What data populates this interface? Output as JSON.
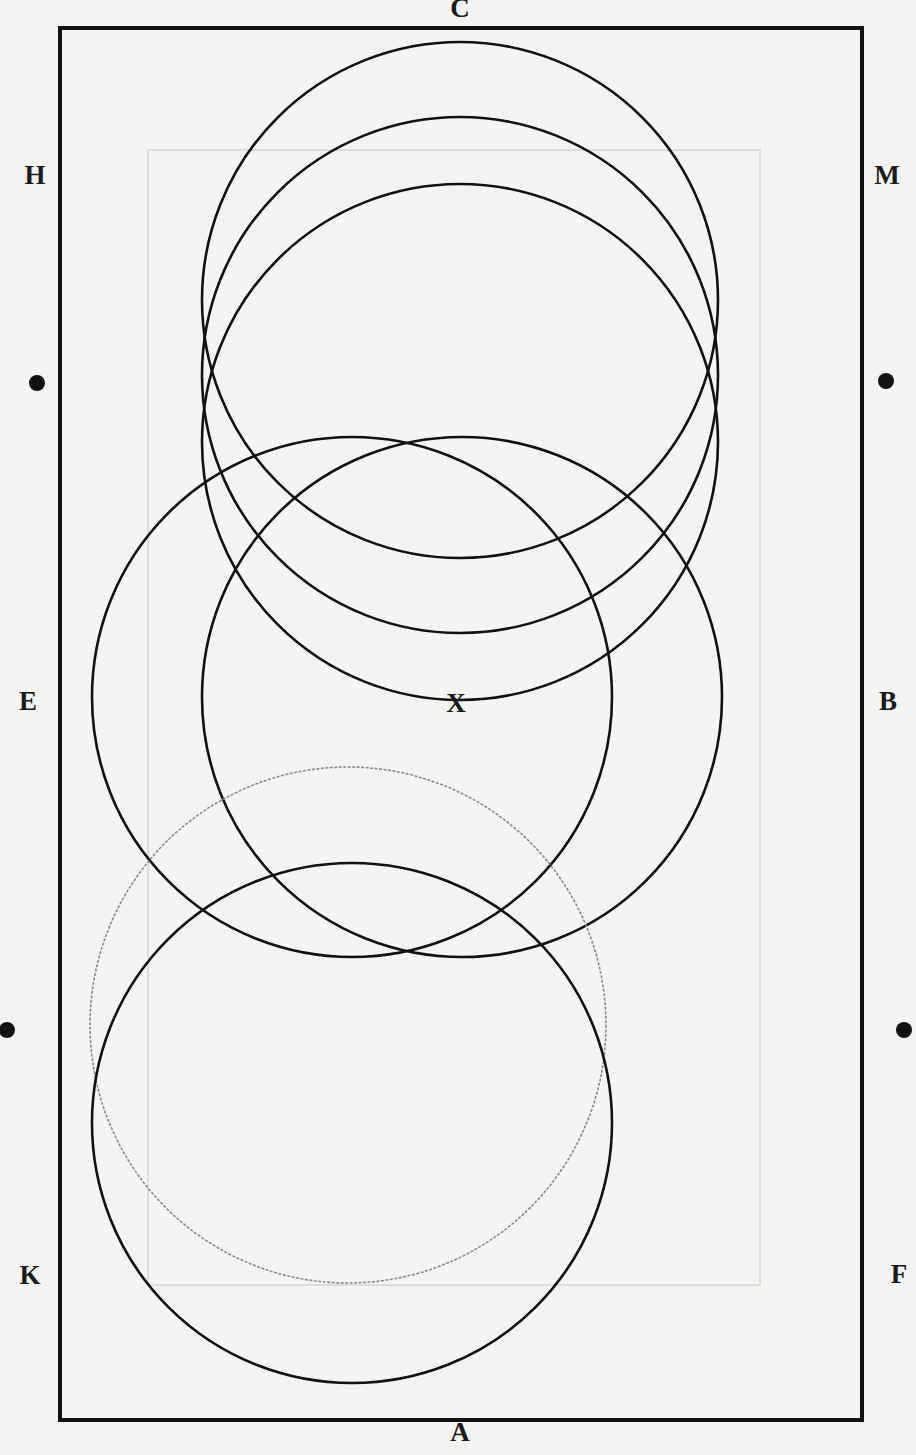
{
  "diagram": {
    "colors": {
      "background": "#f4f4f2",
      "line": "#111111",
      "faint_line": "#8a8a8a",
      "ghost_rect": "#dcdcd8"
    },
    "arena": {
      "x": 60,
      "y": 28,
      "width": 802,
      "height": 1392
    },
    "ghost_rect": {
      "x": 148,
      "y": 150,
      "width": 612,
      "height": 1135
    },
    "letters": [
      {
        "id": "C",
        "text": "C",
        "x": 460,
        "y": 8
      },
      {
        "id": "H",
        "text": "H",
        "x": 35,
        "y": 175
      },
      {
        "id": "M",
        "text": "M",
        "x": 887,
        "y": 175
      },
      {
        "id": "E",
        "text": "E",
        "x": 28,
        "y": 701
      },
      {
        "id": "X",
        "text": "X",
        "x": 456,
        "y": 703
      },
      {
        "id": "B",
        "text": "B",
        "x": 888,
        "y": 701
      },
      {
        "id": "K",
        "text": "K",
        "x": 30,
        "y": 1275
      },
      {
        "id": "F",
        "text": "F",
        "x": 899,
        "y": 1274
      },
      {
        "id": "A",
        "text": "A",
        "x": 460,
        "y": 1432
      }
    ],
    "markers": [
      {
        "x": 37,
        "y": 383
      },
      {
        "x": 886,
        "y": 381
      },
      {
        "x": 7,
        "y": 1030
      },
      {
        "x": 904,
        "y": 1030
      }
    ],
    "circles": [
      {
        "name": "circle-top-1",
        "cx": 460,
        "cy": 300,
        "r": 258,
        "style": "solid"
      },
      {
        "name": "circle-top-2",
        "cx": 460,
        "cy": 375,
        "r": 258,
        "style": "solid"
      },
      {
        "name": "circle-top-3",
        "cx": 460,
        "cy": 442,
        "r": 258,
        "style": "solid"
      },
      {
        "name": "circle-mid-left",
        "cx": 352,
        "cy": 697,
        "r": 260,
        "style": "solid"
      },
      {
        "name": "circle-mid-right",
        "cx": 462,
        "cy": 697,
        "r": 260,
        "style": "solid"
      },
      {
        "name": "circle-faint",
        "cx": 348,
        "cy": 1025,
        "r": 258,
        "style": "faint"
      },
      {
        "name": "circle-bottom",
        "cx": 352,
        "cy": 1123,
        "r": 260,
        "style": "solid"
      }
    ]
  }
}
